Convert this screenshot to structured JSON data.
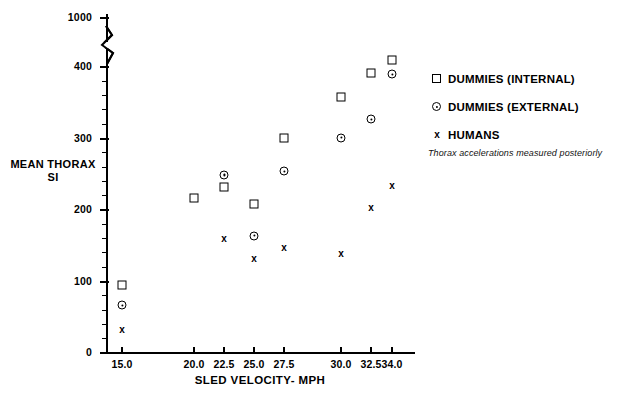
{
  "chart_data": {
    "type": "scatter",
    "title": "",
    "xlabel": "SLED VELOCITY- MPH",
    "ylabel": "MEAN THORAX SI",
    "annotation": "Thorax accelerations measured posteriorly",
    "grid": false,
    "legend_position": "right",
    "x_categories": [
      "15.0",
      "20.0",
      "22.5",
      "25.0",
      "27.5",
      "30.0",
      "32.5",
      "34.0"
    ],
    "x_tick_labels": [
      "15.0",
      "20.0",
      "22.5",
      "25.0",
      "27.5",
      "30.0",
      "32.5",
      "34.0"
    ],
    "y_tick_labels": [
      "0",
      "100",
      "200",
      "300",
      "400",
      "1000"
    ],
    "y_ticks": [
      0,
      100,
      200,
      300,
      400,
      1000
    ],
    "y_axis_break": {
      "from": 400,
      "to": 1000,
      "shown": true
    },
    "ylim": [
      0,
      1000
    ],
    "series": [
      {
        "name": "DUMMIES (INTERNAL)",
        "marker": "square",
        "points": [
          {
            "x": "15.0",
            "y": 95
          },
          {
            "x": "20.0",
            "y": 217
          },
          {
            "x": "22.5",
            "y": 232
          },
          {
            "x": "25.0",
            "y": 209
          },
          {
            "x": "27.5",
            "y": 301
          },
          {
            "x": "30.0",
            "y": 358
          },
          {
            "x": "32.5",
            "y": 392
          },
          {
            "x": "34.0",
            "y": 480
          }
        ]
      },
      {
        "name": "DUMMIES (EXTERNAL)",
        "marker": "circle-dot",
        "points": [
          {
            "x": "15.0",
            "y": 67
          },
          {
            "x": "22.5",
            "y": 249
          },
          {
            "x": "25.0",
            "y": 164
          },
          {
            "x": "27.5",
            "y": 254
          },
          {
            "x": "30.0",
            "y": 301
          },
          {
            "x": "32.5",
            "y": 327
          },
          {
            "x": "34.0",
            "y": 390
          }
        ]
      },
      {
        "name": "HUMANS",
        "marker": "x",
        "points": [
          {
            "x": "15.0",
            "y": 32
          },
          {
            "x": "22.5",
            "y": 160
          },
          {
            "x": "25.0",
            "y": 131
          },
          {
            "x": "27.5",
            "y": 147
          },
          {
            "x": "30.0",
            "y": 138
          },
          {
            "x": "32.5",
            "y": 203
          },
          {
            "x": "34.0",
            "y": 234
          }
        ]
      }
    ]
  },
  "legend": {
    "items": [
      {
        "label": "DUMMIES (INTERNAL)",
        "marker": "square"
      },
      {
        "label": "DUMMIES (EXTERNAL)",
        "marker": "circle-dot"
      },
      {
        "label": "HUMANS",
        "marker": "x"
      }
    ],
    "note": "Thorax accelerations measured posteriorly"
  }
}
